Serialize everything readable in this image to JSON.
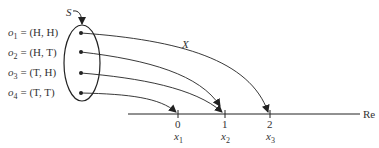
{
  "sample_space": {
    "label": "S",
    "outcomes": [
      {
        "name": "o",
        "sub": "1",
        "value": "= (H, H)",
        "maps_to_index": 1
      },
      {
        "name": "o",
        "sub": "2",
        "value": "= (H, T)",
        "maps_to_index": 1
      },
      {
        "name": "o",
        "sub": "3",
        "value": "= (T, H)",
        "maps_to_index": 0
      },
      {
        "name": "o",
        "sub": "4",
        "value": "= (T, T)",
        "maps_to_index": 0
      }
    ]
  },
  "mapping": {
    "label": "X"
  },
  "axis": {
    "label": "Re",
    "ticks": [
      {
        "value": "0",
        "name": "x",
        "sub": "1"
      },
      {
        "value": "1",
        "name": "x",
        "sub": "2"
      },
      {
        "value": "2",
        "name": "x",
        "sub": "3"
      }
    ]
  }
}
